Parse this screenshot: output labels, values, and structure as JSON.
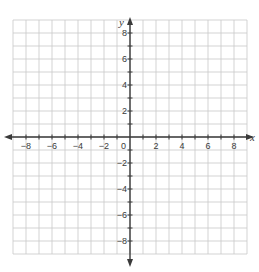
{
  "chart_data": {
    "type": "coordinate-grid",
    "title": "",
    "xlabel": "x",
    "ylabel": "y",
    "xlim": [
      -9,
      9
    ],
    "ylim": [
      -9,
      9
    ],
    "grid": true,
    "grid_step": 1,
    "x_ticks": [
      -8,
      -6,
      -4,
      -2,
      2,
      4,
      6,
      8
    ],
    "y_ticks": [
      8,
      6,
      4,
      2,
      -2,
      -4,
      -6,
      -8
    ],
    "origin_label": "0",
    "series": []
  },
  "colors": {
    "grid": "#c8c8c8",
    "axis": "#3a3a3a",
    "background": "#ffffff"
  }
}
